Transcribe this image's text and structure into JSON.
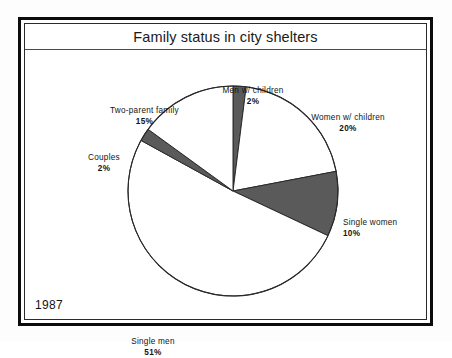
{
  "frame": {
    "title": "Family status in city shelters",
    "year": "1987"
  },
  "chart_data": {
    "type": "pie",
    "title": "Family status in city shelters",
    "subtitle": "",
    "xlabel": "",
    "ylabel": "",
    "legend_position": "none",
    "grid": false,
    "units": "percent",
    "total": 100,
    "start_angle_deg": 0,
    "direction": "clockwise",
    "categories": [
      "Men w/ children",
      "Women w/ children",
      "Single women",
      "Single men",
      "Couples",
      "Two-parent family"
    ],
    "values": [
      2,
      20,
      10,
      51,
      2,
      15
    ],
    "slices": [
      {
        "label": "Men w/ children",
        "value": 2,
        "value_text": "2%",
        "fill": "#5a5a5a",
        "start_deg": 0,
        "end_deg": 7.2
      },
      {
        "label": "Women w/ children",
        "value": 20,
        "value_text": "20%",
        "fill": "#ffffff",
        "start_deg": 7.2,
        "end_deg": 79.2
      },
      {
        "label": "Single women",
        "value": 10,
        "value_text": "10%",
        "fill": "#5a5a5a",
        "start_deg": 79.2,
        "end_deg": 115.2
      },
      {
        "label": "Single men",
        "value": 51,
        "value_text": "51%",
        "fill": "#ffffff",
        "start_deg": 115.2,
        "end_deg": 298.8
      },
      {
        "label": "Couples",
        "value": 2,
        "value_text": "2%",
        "fill": "#5a5a5a",
        "start_deg": 298.8,
        "end_deg": 306.0
      },
      {
        "label": "Two-parent family",
        "value": 15,
        "value_text": "15%",
        "fill": "#ffffff",
        "start_deg": 306.0,
        "end_deg": 360.0
      }
    ],
    "colors": {
      "slice_dark": "#5a5a5a",
      "slice_light": "#ffffff",
      "outline": "#2a2a2a",
      "text": "#141414",
      "frame": "#0c0c0c"
    }
  }
}
